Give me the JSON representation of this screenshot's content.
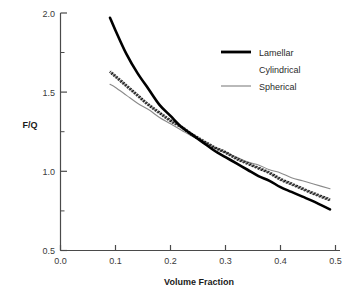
{
  "chart_data": {
    "type": "line",
    "title": "",
    "xlabel": "Volume Fraction",
    "ylabel": "F/Q",
    "xlim": [
      0.0,
      0.5
    ],
    "ylim": [
      0.5,
      2.0
    ],
    "grid": false,
    "legend_position": "top-right",
    "x_ticks": [
      "0.0",
      "0.1",
      "0.2",
      "0.3",
      "0.4",
      "0.5"
    ],
    "x_tick_values": [
      0.0,
      0.1,
      0.2,
      0.3,
      0.4,
      0.5
    ],
    "y_ticks": [
      "0.5",
      "1.0",
      "1.5",
      "2.0"
    ],
    "y_tick_values": [
      0.5,
      1.0,
      1.5,
      2.0
    ],
    "y_minor_tick_values": [
      0.75,
      1.25,
      1.75
    ],
    "x": [
      0.09,
      0.1,
      0.12,
      0.14,
      0.16,
      0.18,
      0.2,
      0.22,
      0.24,
      0.26,
      0.28,
      0.3,
      0.32,
      0.34,
      0.36,
      0.38,
      0.4,
      0.42,
      0.44,
      0.46,
      0.49
    ],
    "series": [
      {
        "name": "Lamellar",
        "style": "thick-solid-black",
        "color": "#000000",
        "values": [
          1.97,
          1.89,
          1.74,
          1.62,
          1.52,
          1.42,
          1.35,
          1.28,
          1.23,
          1.18,
          1.13,
          1.09,
          1.05,
          1.01,
          0.97,
          0.94,
          0.9,
          0.87,
          0.84,
          0.81,
          0.76
        ]
      },
      {
        "name": "Cylindrical",
        "style": "hatched-dotted-black",
        "color": "#1a1a1a",
        "values": [
          1.63,
          1.6,
          1.54,
          1.48,
          1.42,
          1.37,
          1.32,
          1.28,
          1.23,
          1.19,
          1.15,
          1.12,
          1.08,
          1.05,
          1.02,
          0.99,
          0.95,
          0.92,
          0.89,
          0.86,
          0.82
        ]
      },
      {
        "name": "Spherical",
        "style": "thin-solid-gray",
        "color": "#8a8a8a",
        "values": [
          1.55,
          1.53,
          1.48,
          1.43,
          1.39,
          1.34,
          1.3,
          1.26,
          1.22,
          1.19,
          1.15,
          1.12,
          1.09,
          1.06,
          1.04,
          1.01,
          0.99,
          0.96,
          0.94,
          0.92,
          0.89
        ]
      }
    ]
  },
  "legend": {
    "items": [
      {
        "label": "Lamellar"
      },
      {
        "label": "Cylindrical"
      },
      {
        "label": "Spherical"
      }
    ]
  }
}
